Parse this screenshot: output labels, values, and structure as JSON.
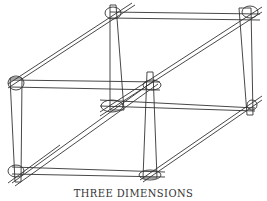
{
  "diagram": {
    "title": "THREE DIMENSIONS",
    "stroke_color": "#333333",
    "background": "#ffffff",
    "rods": [
      {
        "from": [
          8,
          88
        ],
        "to": [
          135,
          5
        ]
      },
      {
        "from": [
          8,
          84
        ],
        "to": [
          132,
          3
        ]
      },
      {
        "from": [
          110,
          12
        ],
        "to": [
          260,
          14
        ]
      },
      {
        "from": [
          110,
          18
        ],
        "to": [
          260,
          20
        ]
      },
      {
        "from": [
          100,
          112
        ],
        "to": [
          262,
          7
        ]
      },
      {
        "from": [
          100,
          116
        ],
        "to": [
          262,
          12
        ]
      },
      {
        "from": [
          10,
          80
        ],
        "to": [
          160,
          82
        ]
      },
      {
        "from": [
          10,
          87
        ],
        "to": [
          160,
          90
        ]
      },
      {
        "from": [
          100,
          100
        ],
        "to": [
          255,
          108
        ]
      },
      {
        "from": [
          100,
          106
        ],
        "to": [
          255,
          111
        ]
      },
      {
        "from": [
          12,
          183
        ],
        "to": [
          155,
          80
        ]
      },
      {
        "from": [
          15,
          186
        ],
        "to": [
          158,
          84
        ]
      },
      {
        "from": [
          12,
          167
        ],
        "to": [
          165,
          172
        ]
      },
      {
        "from": [
          12,
          174
        ],
        "to": [
          165,
          177
        ]
      },
      {
        "from": [
          140,
          180
        ],
        "to": [
          262,
          96
        ]
      },
      {
        "from": [
          143,
          182
        ],
        "to": [
          262,
          100
        ]
      },
      {
        "from": [
          8,
          183
        ],
        "to": [
          60,
          145
        ]
      }
    ],
    "posts": [
      {
        "top": [
          113,
          5
        ],
        "bottom": [
          117,
          110
        ],
        "width_top": 6,
        "width_bottom": 14
      },
      {
        "top": [
          245,
          8
        ],
        "bottom": [
          250,
          115
        ],
        "width_top": 12,
        "width_bottom": 6
      },
      {
        "top": [
          16,
          78
        ],
        "bottom": [
          18,
          182
        ],
        "width_top": 12,
        "width_bottom": 6
      },
      {
        "top": [
          150,
          72
        ],
        "bottom": [
          150,
          178
        ],
        "width_top": 6,
        "width_bottom": 14
      }
    ],
    "joints": [
      {
        "cx": 113,
        "cy": 13,
        "rx": 8,
        "ry": 6
      },
      {
        "cx": 250,
        "cy": 12,
        "rx": 8,
        "ry": 6
      },
      {
        "cx": 16,
        "cy": 83,
        "rx": 8,
        "ry": 7
      },
      {
        "cx": 152,
        "cy": 85,
        "rx": 9,
        "ry": 5
      },
      {
        "cx": 112,
        "cy": 106,
        "rx": 11,
        "ry": 6
      },
      {
        "cx": 252,
        "cy": 105,
        "rx": 5,
        "ry": 5
      },
      {
        "cx": 16,
        "cy": 171,
        "rx": 8,
        "ry": 6
      },
      {
        "cx": 150,
        "cy": 175,
        "rx": 11,
        "ry": 5
      }
    ]
  }
}
